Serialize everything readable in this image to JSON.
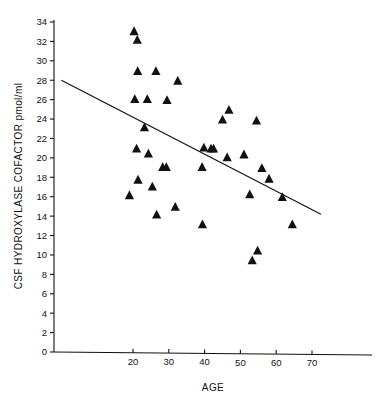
{
  "chart_data": {
    "type": "scatter",
    "title": "",
    "xlabel": "AGE",
    "ylabel": "CSF HYDROXYLASE COFACTOR pmol/ml",
    "xlim": [
      0,
      78
    ],
    "ylim": [
      0,
      34
    ],
    "x_ticks": [
      20,
      30,
      40,
      50,
      60,
      70
    ],
    "y_ticks": [
      0,
      2,
      4,
      6,
      8,
      10,
      12,
      14,
      16,
      18,
      20,
      22,
      24,
      26,
      28,
      30,
      32,
      34
    ],
    "grid": false,
    "legend": null,
    "marker": "triangle-up",
    "marker_color": "#111111",
    "points": [
      {
        "x": 19.0,
        "y": 16.2
      },
      {
        "x": 20.3,
        "y": 33.1
      },
      {
        "x": 20.5,
        "y": 26.1
      },
      {
        "x": 21.0,
        "y": 21.0
      },
      {
        "x": 21.2,
        "y": 32.2
      },
      {
        "x": 21.3,
        "y": 29.0
      },
      {
        "x": 21.4,
        "y": 17.8
      },
      {
        "x": 23.2,
        "y": 23.2
      },
      {
        "x": 24.0,
        "y": 26.1
      },
      {
        "x": 24.3,
        "y": 20.5
      },
      {
        "x": 25.4,
        "y": 17.1
      },
      {
        "x": 26.4,
        "y": 29.0
      },
      {
        "x": 26.6,
        "y": 14.2
      },
      {
        "x": 28.3,
        "y": 19.1
      },
      {
        "x": 29.3,
        "y": 19.1
      },
      {
        "x": 29.5,
        "y": 26.0
      },
      {
        "x": 31.8,
        "y": 15.0
      },
      {
        "x": 32.5,
        "y": 28.0
      },
      {
        "x": 39.3,
        "y": 19.1
      },
      {
        "x": 39.4,
        "y": 13.2
      },
      {
        "x": 39.8,
        "y": 21.1
      },
      {
        "x": 41.8,
        "y": 21.0
      },
      {
        "x": 42.5,
        "y": 21.0
      },
      {
        "x": 45.0,
        "y": 24.0
      },
      {
        "x": 46.3,
        "y": 20.1
      },
      {
        "x": 46.8,
        "y": 25.0
      },
      {
        "x": 51.0,
        "y": 20.4
      },
      {
        "x": 52.6,
        "y": 16.3
      },
      {
        "x": 53.3,
        "y": 9.5
      },
      {
        "x": 54.5,
        "y": 23.9
      },
      {
        "x": 54.8,
        "y": 10.5
      },
      {
        "x": 56.0,
        "y": 19.0
      },
      {
        "x": 58.0,
        "y": 17.9
      },
      {
        "x": 61.7,
        "y": 16.0
      },
      {
        "x": 64.5,
        "y": 13.2
      }
    ],
    "fit_line": {
      "label": "regression-line",
      "x_start": 0,
      "y_start": 28.0,
      "x_end": 72.5,
      "y_end": 14.2
    }
  },
  "axes": {
    "x_axis_name": "AGE",
    "y_axis_name": "CSF HYDROXYLASE COFACTOR pmol/ml"
  }
}
